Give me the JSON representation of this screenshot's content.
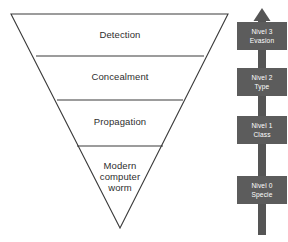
{
  "diagram": {
    "colors": {
      "funnel_stroke": "#3b3b3b",
      "funnel_fill": "#ffffff",
      "axis": "#555555",
      "level_box_fill": "#5c5c5c",
      "level_box_text": "#ffffff",
      "stage_text": "#2e2e2e"
    },
    "funnel": {
      "orientation": "inverted",
      "stages": [
        {
          "label": "Detection"
        },
        {
          "label": "Concealment"
        },
        {
          "label": "Propagation"
        },
        {
          "label": "Modern\ncomputer\nworm"
        }
      ]
    },
    "level_axis": {
      "direction": "upward",
      "arrow_icon": "arrow-up-icon",
      "levels": [
        {
          "level": "Nivel 3",
          "name": "Evasion"
        },
        {
          "level": "Nivel 2",
          "name": "Type"
        },
        {
          "level": "Nivel 1",
          "name": "Class"
        },
        {
          "level": "Nivel 0",
          "name": "Specie"
        }
      ]
    }
  }
}
